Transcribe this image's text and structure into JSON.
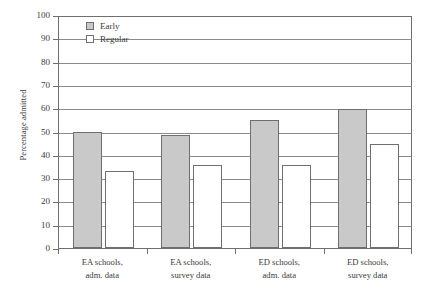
{
  "chart_data": {
    "type": "bar",
    "title": "",
    "xlabel": "",
    "ylabel": "Percentage admitted",
    "ylim": [
      0,
      100
    ],
    "ytick_step": 10,
    "yticks": [
      100,
      90,
      80,
      70,
      60,
      50,
      40,
      30,
      20,
      10,
      0
    ],
    "grid": true,
    "legend_position": "top-left-inside",
    "categories": [
      "EA schools, adm. data",
      "EA schools, survey data",
      "ED schools, adm. data",
      "ED schools, survey data"
    ],
    "categories_lines": [
      [
        "EA schools,",
        "adm. data"
      ],
      [
        "EA schools,",
        "survey data"
      ],
      [
        "ED schools,",
        "adm. data"
      ],
      [
        "ED schools,",
        "survey data"
      ]
    ],
    "series": [
      {
        "name": "Early",
        "color": "#c9c9c9",
        "values": [
          50.0,
          48.5,
          55.0,
          59.5
        ]
      },
      {
        "name": "Regular",
        "color": "#ffffff",
        "values": [
          33.0,
          35.5,
          35.5,
          44.5
        ]
      }
    ]
  },
  "legend": {
    "items": [
      {
        "label": "Early",
        "swatch": "gray-swatch-icon"
      },
      {
        "label": "Regular",
        "swatch": "white-swatch-icon"
      }
    ]
  },
  "axis": {
    "y_title": "Percentage admitted"
  },
  "colors": {
    "early_fill": "#c9c9c9",
    "regular_fill": "#ffffff",
    "line": "#6f6f6f",
    "grid": "#8a8a8a",
    "text": "#3b3b3b",
    "background": "#ffffff"
  }
}
